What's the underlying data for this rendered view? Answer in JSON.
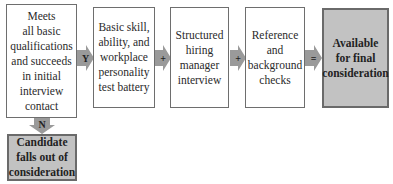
{
  "diagram": {
    "steps": [
      {
        "id": "initial",
        "lines": [
          "Meets",
          "all basic",
          "qualifications",
          "and succeeds",
          "in initial",
          "interview",
          "contact"
        ],
        "fill": "#ffffff"
      },
      {
        "id": "test-battery",
        "lines": [
          "Basic skill,",
          "ability, and",
          "workplace",
          "personality",
          "test battery"
        ],
        "fill": "#ffffff"
      },
      {
        "id": "interview",
        "lines": [
          "Structured",
          "hiring",
          "manager",
          "interview"
        ],
        "fill": "#ffffff"
      },
      {
        "id": "reference",
        "lines": [
          "Reference",
          "and",
          "background",
          "checks"
        ],
        "fill": "#ffffff"
      },
      {
        "id": "available",
        "lines": [
          "Available",
          "for final",
          "consideration"
        ],
        "fill": "#c2c2c2"
      }
    ],
    "reject": {
      "lines": [
        "Candidate",
        "falls out of",
        "consideration"
      ],
      "fill": "#c2c2c2"
    },
    "connectors": {
      "yes": "Y",
      "plus1": "+",
      "plus2": "+",
      "equals": "=",
      "no": "N"
    },
    "colors": {
      "arrow": "#9a9a9a",
      "border": "#6e6e6e",
      "highlight_fill": "#c2c2c2"
    }
  }
}
